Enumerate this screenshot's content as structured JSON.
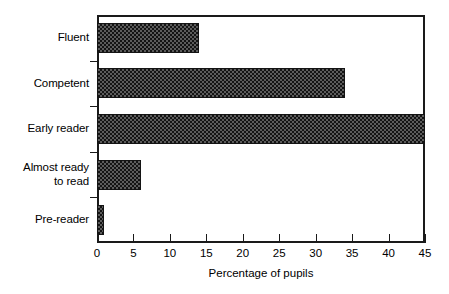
{
  "chart_data": {
    "type": "bar",
    "orientation": "horizontal",
    "title": "",
    "xlabel": "Percentage of pupils",
    "ylabel": "",
    "categories": [
      "Fluent",
      "Competent",
      "Early reader",
      "Almost ready\nto read",
      "Pre-reader"
    ],
    "values": [
      14,
      34,
      45,
      6,
      1
    ],
    "xlim": [
      0,
      45
    ],
    "xticks": [
      0,
      5,
      10,
      15,
      20,
      25,
      30,
      35,
      40,
      45
    ],
    "xticklabels": [
      "0",
      "5",
      "10",
      "15",
      "20",
      "25",
      "30",
      "35",
      "40",
      "45"
    ],
    "grid": false,
    "legend": null,
    "series": [
      {
        "name": "Percentage of pupils",
        "values": [
          14,
          34,
          45,
          6,
          1
        ]
      }
    ],
    "colors": {
      "bar_fill": "#5c5c5c",
      "bar_pattern": "#141414",
      "bar_edge": "#141414",
      "axis": "#1a1a1a",
      "text": "#000000",
      "background": "#ffffff"
    }
  }
}
